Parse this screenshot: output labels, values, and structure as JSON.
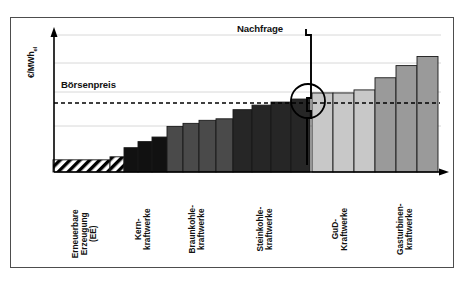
{
  "figure": {
    "y_axis_label": "€/MWh",
    "y_axis_label_sub": "el",
    "annotations": {
      "price_label": "Börsenpreis",
      "demand_label": "Nachfrage"
    },
    "colors": {
      "renewable": "#ffffff",
      "renewable_hatch": "#000000",
      "nuclear": "#111111",
      "lignite": "#4a4a4a",
      "hardcoal": "#262626",
      "ccgt": "#c8c8c8",
      "gasturbine": "#9a9a9a",
      "frame": "#4d4d4d",
      "gridline": "#d8d8d8",
      "axis": "#000000"
    }
  },
  "chart_data": {
    "type": "bar",
    "title": "",
    "subtitle": "",
    "xlabel": "",
    "ylabel": "€/MWh el",
    "xlim": [
      0,
      100
    ],
    "ylim": [
      0,
      100
    ],
    "grid": true,
    "legend_position": "none",
    "axis_ticks_shown": false,
    "categories": [
      "Erneuerbare Erzeugung (EE)",
      "Kern-kraftwerke",
      "Braunkohle-kraftwerke",
      "Steinkohle-kraftwerke",
      "GuD-Kraftwerke",
      "Gasturbinen-kraftwerke"
    ],
    "category_label_lines": [
      [
        "Erneuerbare",
        "Erzeugung",
        "(EE)"
      ],
      [
        "Kern-",
        "kraftwerke"
      ],
      [
        "Braunkohle-",
        "kraftwerke"
      ],
      [
        "Steinkohle-",
        "kraftwerke"
      ],
      [
        "GuD-",
        "Kraftwerke"
      ],
      [
        "Gasturbinen-",
        "kraftwerke"
      ]
    ],
    "category_label_x": [
      85,
      143,
      197,
      265,
      340,
      405
    ],
    "groups": [
      {
        "name": "Erneuerbare Erzeugung (EE)",
        "fill": "hatch",
        "x_start": 53,
        "x_end": 124,
        "bars": [
          {
            "x": 53,
            "width": 57,
            "value": 8
          },
          {
            "x": 110,
            "width": 14,
            "value": 10
          }
        ]
      },
      {
        "name": "Kernkraftwerke",
        "fill": "#111111",
        "x_start": 124,
        "x_end": 167,
        "bars": [
          {
            "x": 124,
            "width": 14,
            "value": 16
          },
          {
            "x": 138,
            "width": 14,
            "value": 20
          },
          {
            "x": 152,
            "width": 15,
            "value": 23
          }
        ]
      },
      {
        "name": "Braunkohlekraftwerke",
        "fill": "#4a4a4a",
        "x_start": 167,
        "x_end": 233,
        "bars": [
          {
            "x": 167,
            "width": 16,
            "value": 30
          },
          {
            "x": 183,
            "width": 16,
            "value": 32
          },
          {
            "x": 199,
            "width": 17,
            "value": 34
          },
          {
            "x": 216,
            "width": 17,
            "value": 35
          }
        ]
      },
      {
        "name": "Steinkohlekraftwerke",
        "fill": "#262626",
        "x_start": 233,
        "x_end": 310,
        "bars": [
          {
            "x": 233,
            "width": 19,
            "value": 41
          },
          {
            "x": 252,
            "width": 19,
            "value": 44
          },
          {
            "x": 271,
            "width": 20,
            "value": 46
          },
          {
            "x": 291,
            "width": 19,
            "value": 48
          }
        ]
      },
      {
        "name": "GuD-Kraftwerke",
        "fill": "#c8c8c8",
        "x_start": 312,
        "x_end": 375,
        "bars": [
          {
            "x": 312,
            "width": 21,
            "value": 52
          },
          {
            "x": 333,
            "width": 21,
            "value": 52
          },
          {
            "x": 354,
            "width": 21,
            "value": 54
          }
        ]
      },
      {
        "name": "Gasturbinenkraftwerke",
        "fill": "#9a9a9a",
        "x_start": 375,
        "x_end": 438,
        "bars": [
          {
            "x": 375,
            "width": 21,
            "value": 62
          },
          {
            "x": 396,
            "width": 21,
            "value": 70
          },
          {
            "x": 417,
            "width": 21,
            "value": 76
          }
        ]
      }
    ],
    "gridlines_y": [
      35,
      63,
      92,
      126
    ],
    "price_line": {
      "label": "Börsenpreis",
      "y": 103,
      "style": "dashed",
      "x_start": 54,
      "x_end": 440
    },
    "demand_curve": {
      "label": "Nachfrage",
      "style": "step",
      "points": [
        [
          306,
          29
        ],
        [
          306,
          35
        ],
        [
          311,
          35
        ],
        [
          311,
          98
        ],
        [
          307,
          98
        ],
        [
          307,
          111
        ],
        [
          311,
          111
        ],
        [
          311,
          118
        ],
        [
          307,
          118
        ],
        [
          307,
          165
        ]
      ]
    },
    "intersection_marker": {
      "shape": "circle",
      "cx": 308,
      "cy": 101,
      "r": 17
    }
  }
}
